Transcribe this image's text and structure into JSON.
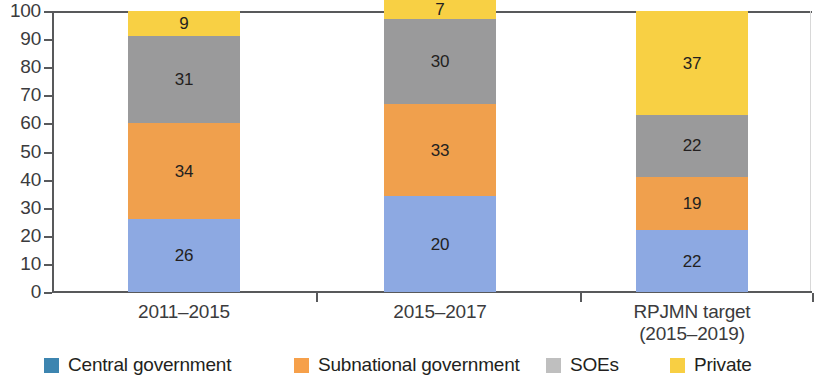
{
  "chart_data": {
    "type": "bar",
    "subtype": "stacked-bar-100",
    "title": "",
    "subtitle": "",
    "xlabel": "",
    "ylabel": "",
    "ylim": [
      0,
      100
    ],
    "yticks": [
      0,
      10,
      20,
      30,
      40,
      50,
      60,
      70,
      80,
      90,
      100
    ],
    "grid": false,
    "legend_position": "bottom",
    "categories": [
      "2011–2015",
      "2015–2017",
      "RPJMN target\n(2015–2019)"
    ],
    "category_lines": [
      [
        "2011–2015"
      ],
      [
        "2015–2017"
      ],
      [
        "RPJMN target",
        "(2015–2019)"
      ]
    ],
    "series": [
      {
        "name": "Central government",
        "color": "#8DA9E2",
        "legend_color": "#3D85B0",
        "values": [
          26,
          34,
          22
        ]
      },
      {
        "name": "Subnational government",
        "color": "#F0A04D",
        "legend_color": "#F6A04A",
        "values": [
          34,
          33,
          19
        ]
      },
      {
        "name": "SOEs",
        "color": "#9A9A9B",
        "legend_color": "#BFBFBF",
        "values": [
          31,
          30,
          22
        ]
      },
      {
        "name": "Private",
        "color": "#F8D044",
        "legend_color": "#F8CF43",
        "values": [
          9,
          7,
          37
        ]
      }
    ],
    "totals": [
      100,
      90,
      100
    ],
    "bar_labels": [
      [
        "26",
        "34",
        "31",
        "9"
      ],
      [
        "20",
        "33",
        "30",
        "7"
      ],
      [
        "22",
        "19",
        "22",
        "37"
      ]
    ],
    "axis_color": "#58595b",
    "text_color": "#231f20"
  },
  "yaxis": {
    "ticks": [
      "0",
      "10",
      "20",
      "30",
      "40",
      "50",
      "60",
      "70",
      "80",
      "90",
      "100"
    ]
  },
  "legend": {
    "items": [
      {
        "label": "Central government"
      },
      {
        "label": "Subnational government"
      },
      {
        "label": "SOEs"
      },
      {
        "label": "Private"
      }
    ]
  }
}
